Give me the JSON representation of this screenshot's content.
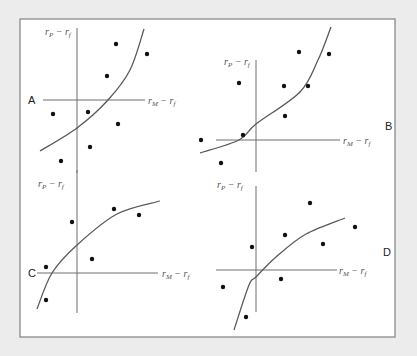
{
  "figure": {
    "panels": [
      {
        "id": "A",
        "letter": "A",
        "y_axis_label": {
          "base": "r",
          "sub": "P",
          "minus": " − ",
          "base2": "r",
          "sub2": "f"
        },
        "x_axis_label": {
          "base": "r",
          "sub": "M",
          "minus": " − ",
          "base2": "r",
          "sub2": "f"
        },
        "curve_shape": "convex"
      },
      {
        "id": "B",
        "letter": "B",
        "y_axis_label": {
          "base": "r",
          "sub": "P",
          "minus": " − ",
          "base2": "r",
          "sub2": "f"
        },
        "x_axis_label": {
          "base": "r",
          "sub": "M",
          "minus": " − ",
          "base2": "r",
          "sub2": "f"
        },
        "curve_shape": "convex"
      },
      {
        "id": "C",
        "letter": "C",
        "y_axis_label": {
          "base": "r",
          "sub": "P",
          "minus": " − ",
          "base2": "r",
          "sub2": "f"
        },
        "x_axis_label": {
          "base": "r",
          "sub": "M",
          "minus": " − ",
          "base2": "r",
          "sub2": "f"
        },
        "curve_shape": "concave"
      },
      {
        "id": "D",
        "letter": "D",
        "y_axis_label": {
          "base": "r",
          "sub": "P",
          "minus": " − ",
          "base2": "r",
          "sub2": "f"
        },
        "x_axis_label": {
          "base": "r",
          "sub": "M",
          "minus": " − ",
          "base2": "r",
          "sub2": "f"
        },
        "curve_shape": "concave"
      }
    ]
  },
  "chart_data": [
    {
      "type": "scatter",
      "title": "A",
      "xlabel": "rM − rf",
      "ylabel": "rP − rf",
      "xlim": [
        -3,
        6.5
      ],
      "ylim": [
        -6,
        6
      ],
      "points": [
        {
          "x": 3.9,
          "y": 5.6
        },
        {
          "x": 7.0,
          "y": 4.6
        },
        {
          "x": 3.0,
          "y": 2.4
        },
        {
          "x": -2.4,
          "y": -1.4
        },
        {
          "x": 1.1,
          "y": -1.2
        },
        {
          "x": 4.1,
          "y": -2.4
        },
        {
          "x": 1.3,
          "y": -4.7
        },
        {
          "x": -1.6,
          "y": -6.1
        }
      ],
      "curve": [
        {
          "x": -3.7,
          "y": -5.1
        },
        {
          "x": 0.0,
          "y": -2.8
        },
        {
          "x": 3.1,
          "y": 0.0
        },
        {
          "x": 5.3,
          "y": 3.0
        },
        {
          "x": 6.7,
          "y": 7.1
        }
      ]
    },
    {
      "type": "scatter",
      "title": "B",
      "xlabel": "rM − rf",
      "ylabel": "rP − rf",
      "xlim": [
        -4,
        8
      ],
      "ylim": [
        -3,
        8
      ],
      "points": [
        {
          "x": 4.3,
          "y": 8.8
        },
        {
          "x": 7.3,
          "y": 8.6
        },
        {
          "x": -1.7,
          "y": 5.7
        },
        {
          "x": 2.8,
          "y": 5.4
        },
        {
          "x": 5.2,
          "y": 5.4
        },
        {
          "x": 2.9,
          "y": 2.4
        },
        {
          "x": -1.3,
          "y": 0.5
        },
        {
          "x": -5.5,
          "y": 0.0
        },
        {
          "x": -3.5,
          "y": -2.3
        }
      ],
      "curve": [
        {
          "x": -5.6,
          "y": -1.3
        },
        {
          "x": -1.7,
          "y": 0.0
        },
        {
          "x": 0.0,
          "y": 1.6
        },
        {
          "x": 4.4,
          "y": 4.8
        },
        {
          "x": 6.2,
          "y": 8.0
        },
        {
          "x": 7.5,
          "y": 11.3
        }
      ]
    },
    {
      "type": "scatter",
      "title": "C",
      "xlabel": "rM − rf",
      "ylabel": "rP − rf",
      "xlim": [
        -4,
        8
      ],
      "ylim": [
        -4,
        10
      ],
      "points": [
        {
          "x": 3.7,
          "y": 6.4
        },
        {
          "x": 6.2,
          "y": 5.8
        },
        {
          "x": -0.5,
          "y": 5.1
        },
        {
          "x": 1.5,
          "y": 1.4
        },
        {
          "x": -3.1,
          "y": 0.6
        },
        {
          "x": -3.1,
          "y": -2.7
        }
      ],
      "curve": [
        {
          "x": -4.0,
          "y": -3.6
        },
        {
          "x": -2.5,
          "y": 0.0
        },
        {
          "x": 0.0,
          "y": 2.8
        },
        {
          "x": 4.0,
          "y": 5.9
        },
        {
          "x": 8.3,
          "y": 7.2
        }
      ]
    },
    {
      "type": "scatter",
      "title": "D",
      "xlabel": "rM − rf",
      "ylabel": "rP − rf",
      "xlim": [
        -4,
        8
      ],
      "ylim": [
        -5,
        8
      ],
      "points": [
        {
          "x": 5.4,
          "y": 6.7
        },
        {
          "x": 9.9,
          "y": 4.3
        },
        {
          "x": -0.4,
          "y": 2.3
        },
        {
          "x": 2.9,
          "y": 3.5
        },
        {
          "x": 6.7,
          "y": 2.6
        },
        {
          "x": 2.5,
          "y": -0.9
        },
        {
          "x": -3.3,
          "y": -1.7
        },
        {
          "x": -1.0,
          "y": -4.7
        }
      ],
      "curve": [
        {
          "x": -2.2,
          "y": -6.0
        },
        {
          "x": -0.7,
          "y": -1.5
        },
        {
          "x": 0.0,
          "y": -0.7
        },
        {
          "x": 2.0,
          "y": 1.3
        },
        {
          "x": 5.0,
          "y": 3.6
        },
        {
          "x": 8.9,
          "y": 5.2
        }
      ]
    }
  ]
}
